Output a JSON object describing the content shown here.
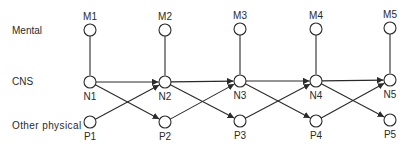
{
  "rows": [
    {
      "id": "mental",
      "label": "Mental",
      "x": 12,
      "y": 34
    },
    {
      "id": "cns",
      "label": "CNS",
      "x": 12,
      "y": 85
    },
    {
      "id": "physical",
      "label": "Other physical",
      "x": 12,
      "y": 129
    }
  ],
  "nodes": [
    {
      "id": "M1",
      "label": "M1",
      "x": 90,
      "y": 30,
      "label_pos": "above"
    },
    {
      "id": "M2",
      "label": "M2",
      "x": 165,
      "y": 30,
      "label_pos": "above"
    },
    {
      "id": "M3",
      "label": "M3",
      "x": 240,
      "y": 29,
      "label_pos": "above"
    },
    {
      "id": "M4",
      "label": "M4",
      "x": 316,
      "y": 29,
      "label_pos": "above"
    },
    {
      "id": "M5",
      "label": "M5",
      "x": 390,
      "y": 28,
      "label_pos": "above"
    },
    {
      "id": "N1",
      "label": "N1",
      "x": 90,
      "y": 82,
      "label_pos": "below"
    },
    {
      "id": "N2",
      "label": "N2",
      "x": 165,
      "y": 82,
      "label_pos": "below"
    },
    {
      "id": "N3",
      "label": "N3",
      "x": 240,
      "y": 81,
      "label_pos": "below"
    },
    {
      "id": "N4",
      "label": "N4",
      "x": 316,
      "y": 81,
      "label_pos": "below"
    },
    {
      "id": "N5",
      "label": "N5",
      "x": 390,
      "y": 80,
      "label_pos": "below"
    },
    {
      "id": "P1",
      "label": "P1",
      "x": 90,
      "y": 122,
      "label_pos": "below"
    },
    {
      "id": "P2",
      "label": "P2",
      "x": 165,
      "y": 122,
      "label_pos": "below"
    },
    {
      "id": "P3",
      "label": "P3",
      "x": 240,
      "y": 121,
      "label_pos": "below"
    },
    {
      "id": "P4",
      "label": "P4",
      "x": 316,
      "y": 121,
      "label_pos": "below"
    },
    {
      "id": "P5",
      "label": "P5",
      "x": 390,
      "y": 120,
      "label_pos": "below"
    }
  ],
  "edges": [
    {
      "from": "M1",
      "to": "N1",
      "arrow": false
    },
    {
      "from": "M2",
      "to": "N2",
      "arrow": false
    },
    {
      "from": "M3",
      "to": "N3",
      "arrow": false
    },
    {
      "from": "M4",
      "to": "N4",
      "arrow": false
    },
    {
      "from": "M5",
      "to": "N5",
      "arrow": false
    },
    {
      "from": "N1",
      "to": "N2",
      "arrow": true
    },
    {
      "from": "N2",
      "to": "N3",
      "arrow": true
    },
    {
      "from": "N3",
      "to": "N4",
      "arrow": true
    },
    {
      "from": "N4",
      "to": "N5",
      "arrow": true
    },
    {
      "from": "N1",
      "to": "P2",
      "arrow": true
    },
    {
      "from": "N2",
      "to": "P3",
      "arrow": true
    },
    {
      "from": "N3",
      "to": "P4",
      "arrow": true
    },
    {
      "from": "N4",
      "to": "P5",
      "arrow": true
    },
    {
      "from": "P1",
      "to": "N2",
      "arrow": true
    },
    {
      "from": "P2",
      "to": "N3",
      "arrow": true
    },
    {
      "from": "P3",
      "to": "N4",
      "arrow": true
    },
    {
      "from": "P4",
      "to": "N5",
      "arrow": true
    }
  ],
  "style": {
    "stroke": "#2a2a2a",
    "background": "#ffffff",
    "node_radius": 6
  }
}
